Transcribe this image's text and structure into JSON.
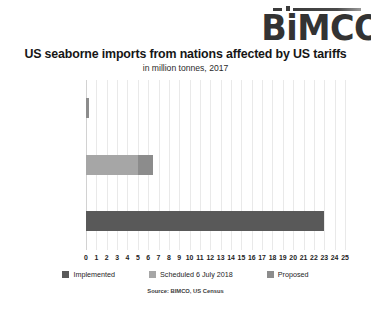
{
  "logo": {
    "text": "BiMCO",
    "accent_icon": "dash-dot-line"
  },
  "chart_data": {
    "type": "bar",
    "orientation": "horizontal",
    "stacked": true,
    "title": "US seaborne imports from nations affected by US tariffs",
    "subtitle": "in million tonnes, 2017",
    "source": "Source: BIMCO, US Census",
    "xlabel": "",
    "ylabel": "",
    "xlim": [
      0,
      25
    ],
    "xticks": [
      0,
      1,
      2,
      3,
      4,
      5,
      6,
      7,
      8,
      9,
      10,
      11,
      12,
      13,
      14,
      15,
      16,
      17,
      18,
      19,
      20,
      21,
      22,
      23,
      24,
      25
    ],
    "grid": true,
    "legend_position": "bottom",
    "categories": [
      "Oil products",
      "Containerised goods",
      "Dry bulk products"
    ],
    "series": [
      {
        "name": "Implemented",
        "color": "#595959",
        "values": [
          0.0,
          0.0,
          23.0
        ]
      },
      {
        "name": "Scheduled 6 July 2018",
        "color": "#a6a6a6",
        "values": [
          0.0,
          5.0,
          0.0
        ]
      },
      {
        "name": "Proposed",
        "color": "#8c8c8c",
        "values": [
          0.3,
          1.5,
          0.0
        ]
      }
    ],
    "totals": [
      0.3,
      6.5,
      23.0
    ]
  }
}
